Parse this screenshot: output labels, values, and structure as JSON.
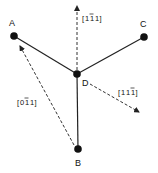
{
  "nodes": {
    "A": {
      "label": "A",
      "x": 14,
      "y": 36,
      "lx": 9,
      "ly": 26
    },
    "B": {
      "label": "B",
      "x": 78,
      "y": 149,
      "lx": 75,
      "ly": 166
    },
    "C": {
      "label": "C",
      "x": 144,
      "y": 37,
      "lx": 140,
      "ly": 27
    },
    "D": {
      "label": "D",
      "x": 77,
      "y": 74,
      "lx": 82,
      "ly": 86
    }
  },
  "edges": [
    {
      "from": "A",
      "to": "D"
    },
    {
      "from": "C",
      "to": "D"
    },
    {
      "from": "B",
      "to": "D"
    }
  ],
  "directions": [
    {
      "label": "[1̅1̅1]",
      "digits": [
        "1",
        "1",
        "1"
      ],
      "bars": [
        false,
        true,
        false
      ],
      "from": [
        77,
        70
      ],
      "to": [
        77,
        5
      ],
      "lx": 82,
      "ly": 21
    },
    {
      "label": "[111̅]",
      "digits": [
        "1",
        "1",
        "1"
      ],
      "bars": [
        false,
        false,
        true
      ],
      "from": [
        90,
        84
      ],
      "to": [
        140,
        113
      ],
      "lx": 118,
      "ly": 95
    },
    {
      "label": "[01̅1]",
      "digits": [
        "0",
        "1",
        "1"
      ],
      "bars": [
        false,
        true,
        false
      ],
      "from": [
        74,
        145
      ],
      "to": [
        19,
        45
      ],
      "lx": 17,
      "ly": 105
    }
  ],
  "colors": {
    "line": "#222222",
    "node": "#111111",
    "dashed": "#333333"
  }
}
